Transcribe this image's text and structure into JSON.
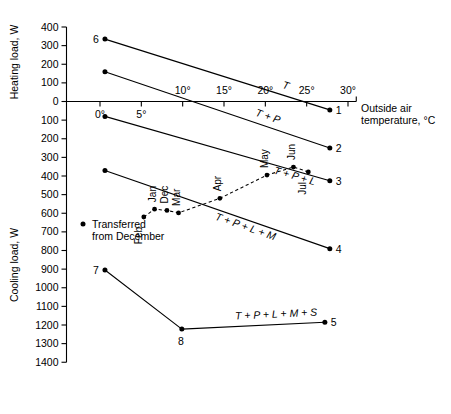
{
  "chart_data": {
    "type": "line",
    "title": "",
    "xlabel": "Outside air temperature, °C",
    "ylabel_upper": "Heating load, W",
    "ylabel_lower": "Cooling load, W",
    "xlim": [
      -2,
      32
    ],
    "x_ticks": [
      0,
      5,
      10,
      15,
      20,
      25,
      30
    ],
    "x_tick_labels": [
      "0°",
      "5°",
      "10°",
      "15°",
      "20°",
      "25°",
      "30°"
    ],
    "y_ticks_heating": [
      400,
      300,
      200,
      100,
      0
    ],
    "y_tick_labels_heating": [
      "400",
      "300",
      "200",
      "100",
      "0"
    ],
    "y_ticks_cooling": [
      100,
      200,
      300,
      400,
      500,
      600,
      700,
      800,
      900,
      1000,
      1100,
      1200,
      1300,
      1400
    ],
    "y_tick_labels_cooling": [
      "100",
      "200",
      "300",
      "400",
      "500",
      "600",
      "700",
      "800",
      "900",
      "1000",
      "1100",
      "1200",
      "1300",
      "1400"
    ],
    "ylim_signed": [
      400,
      -1400
    ],
    "grid": false,
    "legend_position": "inside-left",
    "series": [
      {
        "name": "T",
        "annotation": "T",
        "endpoint_label": "1",
        "start_label": "6",
        "points": [
          {
            "x": 0.6,
            "y": 335
          },
          {
            "x": 27.8,
            "y": -45
          }
        ]
      },
      {
        "name": "T + P",
        "annotation": "T + P",
        "endpoint_label": "2",
        "start_label": "",
        "points": [
          {
            "x": 0.6,
            "y": 160
          },
          {
            "x": 27.8,
            "y": -250
          }
        ]
      },
      {
        "name": "T + P + L",
        "annotation": "T + P + L",
        "endpoint_label": "3",
        "start_label": "",
        "points": [
          {
            "x": 0.6,
            "y": -80
          },
          {
            "x": 27.8,
            "y": -425
          }
        ]
      },
      {
        "name": "T + P + L + M",
        "annotation": "T + P + L + M",
        "endpoint_label": "4",
        "start_label": "",
        "points": [
          {
            "x": 0.6,
            "y": -370
          },
          {
            "x": 27.8,
            "y": -790
          }
        ]
      },
      {
        "name": "T + P + L + M + S",
        "annotation": "T + P + L + M + S",
        "endpoint_label": "5",
        "start_label": "7",
        "points": [
          {
            "x": 0.6,
            "y": -905
          },
          {
            "x": 9.9,
            "y": -1222
          },
          {
            "x": 27.2,
            "y": -1185
          }
        ],
        "intermediate_label": "8",
        "intermediate_index": 1
      }
    ],
    "month_track": {
      "name": "monthly-operating-points",
      "style": "dashed",
      "months": [
        {
          "label": "Feb",
          "x": 5.3,
          "y": -620
        },
        {
          "label": "Jan",
          "x": 6.6,
          "y": -578
        },
        {
          "label": "Dec",
          "x": 8.1,
          "y": -585
        },
        {
          "label": "Mar",
          "x": 9.5,
          "y": -598
        },
        {
          "label": "Apr",
          "x": 14.5,
          "y": -520
        },
        {
          "label": "May",
          "x": 20.2,
          "y": -395
        },
        {
          "label": "Jun",
          "x": 23.4,
          "y": -352
        },
        {
          "label": "Jul",
          "x": 25.2,
          "y": -378
        }
      ]
    },
    "legend": {
      "marker": "filled-circle",
      "line1": "Transferred",
      "line2": "from December"
    },
    "caption": ""
  },
  "figure": {
    "axis_color": "#000000",
    "line_color": "#000000",
    "background": "#ffffff"
  }
}
